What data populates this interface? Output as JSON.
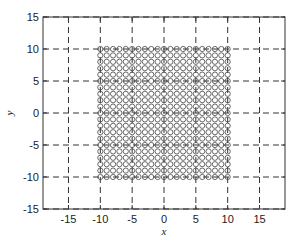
{
  "chart_data": {
    "type": "scatter",
    "title": "",
    "xlabel": "x",
    "ylabel": "y",
    "xlim": [
      -19,
      19
    ],
    "ylim": [
      -15,
      15
    ],
    "xticks": [
      -15,
      -10,
      -5,
      0,
      5,
      10,
      15
    ],
    "yticks": [
      -15,
      -10,
      -5,
      0,
      5,
      10,
      15
    ],
    "grid": true,
    "grid_style": "dashed",
    "marker": "open-circle",
    "series": [
      {
        "name": "grid points",
        "description": "Regular grid of points from -10 to 10 in steps of 1 on both axes (21 x 21 = 441 points)",
        "x_range": [
          -10,
          10
        ],
        "y_range": [
          -10,
          10
        ],
        "step": 1
      }
    ],
    "legend": null
  },
  "colors": {
    "axes": "#333333",
    "grid": "#333333",
    "marker": "#444444",
    "background": "#ffffff"
  }
}
